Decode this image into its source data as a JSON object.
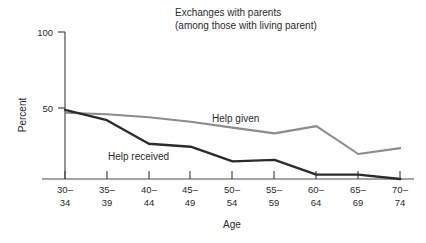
{
  "chart_data": {
    "type": "line",
    "title": "Exchanges with parents",
    "subtitle": "(among those with living parent)",
    "xlabel": "Age",
    "ylabel": "Percent",
    "categories": [
      "30–\n34",
      "35–\n39",
      "40–\n44",
      "45–\n49",
      "50–\n54",
      "55–\n59",
      "60–\n64",
      "65–\n69",
      "70–\n74"
    ],
    "category_top": [
      "30–",
      "35–",
      "40–",
      "45–",
      "50–",
      "55–",
      "60–",
      "65–",
      "70–"
    ],
    "category_bottom": [
      "34",
      "39",
      "44",
      "49",
      "54",
      "59",
      "64",
      "69",
      "74"
    ],
    "ylim": [
      0,
      100
    ],
    "yticks": [
      50,
      100
    ],
    "ytick_labels": [
      "50",
      "100"
    ],
    "grid": false,
    "legend_position": "inline-annotation",
    "series": [
      {
        "name": "Help given",
        "color": "#8c8c8c",
        "label_x": 212,
        "label_y": 122,
        "values": [
          45,
          44,
          42,
          39,
          35,
          31,
          36,
          17,
          21
        ]
      },
      {
        "name": "Help received",
        "color": "#2b2b2b",
        "label_x": 108,
        "label_y": 160,
        "values": [
          47,
          40,
          24,
          22,
          12,
          13,
          3,
          3,
          0
        ]
      }
    ]
  }
}
